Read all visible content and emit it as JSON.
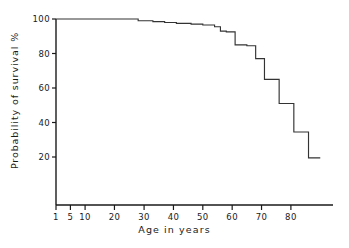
{
  "chart_data": {
    "type": "line",
    "title": "",
    "subtitle": "",
    "xlabel": "Age in years",
    "ylabel": "Probability of survival %",
    "grid": false,
    "legend": "none",
    "step_style": "post",
    "xlim": [
      1,
      90
    ],
    "ylim": [
      0,
      100
    ],
    "x_tick_labels": [
      "1",
      "5",
      "10",
      "20",
      "30",
      "40",
      "50",
      "60",
      "70",
      "80"
    ],
    "x_tick_values": [
      1,
      5,
      10,
      20,
      30,
      40,
      50,
      60,
      70,
      80
    ],
    "x_tick_positions_frac": [
      0.0,
      0.052,
      0.105,
      0.211,
      0.318,
      0.424,
      0.53,
      0.636,
      0.742,
      0.848
    ],
    "y_tick_labels": [
      "20",
      "40",
      "60",
      "80",
      "100"
    ],
    "y_tick_values": [
      20,
      40,
      60,
      80,
      100
    ],
    "series": [
      {
        "name": "Survival",
        "x": [
          1,
          25,
          28,
          33,
          37,
          41,
          46,
          50,
          54,
          56,
          58,
          61,
          65,
          68,
          71,
          76,
          81,
          86,
          90
        ],
        "values": [
          100,
          100,
          99,
          98.5,
          98,
          97.5,
          97,
          96.5,
          95.5,
          93,
          92.5,
          85,
          84.5,
          77,
          65,
          51,
          34.5,
          19.5,
          19.5
        ]
      }
    ],
    "annotations": [],
    "colors": {
      "line": "#333333",
      "axis": "#1a1a1a",
      "background": "#ffffff"
    }
  }
}
